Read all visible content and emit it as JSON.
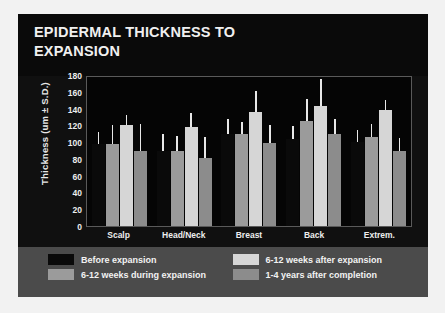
{
  "slide": {
    "title": "EPIDERMAL THICKNESS TO\nEXPANSION",
    "background_color": "#101010",
    "title_band_color": "#0a0a0a",
    "legend_band_color": "#4b4b4b",
    "plot_background_color": "#050505",
    "page_background_color": "#f2f2f2"
  },
  "chart_data": {
    "type": "bar",
    "title": "EPIDERMAL THICKNESS TO EXPANSION",
    "xlabel": "",
    "ylabel": "Thickness (um ± S.D.)",
    "ylim": [
      0,
      180
    ],
    "yticks": [
      180,
      160,
      140,
      120,
      100,
      80,
      60,
      40,
      20,
      0
    ],
    "grid": false,
    "legend_position": "bottom",
    "error_type": "S.D.",
    "categories": [
      "Scalp",
      "Head/Neck",
      "Breast",
      "Back",
      "Extrem."
    ],
    "series": [
      {
        "name": "Before expansion",
        "color": "#0a0a0a",
        "values": [
          98,
          90,
          110,
          104,
          100
        ],
        "errors": [
          14,
          20,
          17,
          15,
          15
        ]
      },
      {
        "name": "6-12 weeks during expansion",
        "color": "#9b9b9b",
        "values": [
          98,
          89,
          110,
          125,
          106
        ],
        "errors": [
          23,
          18,
          14,
          26,
          16
        ]
      },
      {
        "name": "6-12 weeks after expansion",
        "color": "#d6d6d6",
        "values": [
          120,
          118,
          136,
          143,
          138
        ],
        "errors": [
          12,
          17,
          25,
          32,
          12
        ]
      },
      {
        "name": "1-4 years after completion",
        "color": "#8c8c8c",
        "values": [
          90,
          81,
          99,
          110,
          90
        ],
        "errors": [
          32,
          25,
          21,
          17,
          15
        ]
      }
    ]
  },
  "legend": {
    "items": [
      {
        "label": "Before expansion",
        "color": "#0a0a0a"
      },
      {
        "label": "6-12 weeks after expansion",
        "color": "#d6d6d6"
      },
      {
        "label": "6-12 weeks during expansion",
        "color": "#9b9b9b"
      },
      {
        "label": "1-4 years after completion",
        "color": "#8c8c8c"
      }
    ]
  }
}
